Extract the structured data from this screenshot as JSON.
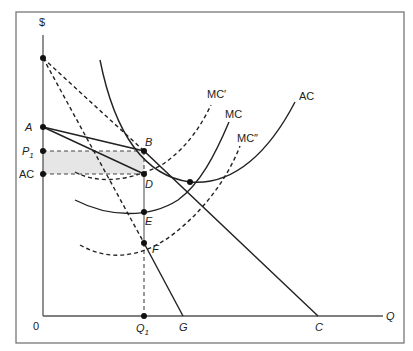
{
  "diagram": {
    "type": "economics-cost-revenue-diagram",
    "axes": {
      "y_label": "$",
      "x_label": "Q",
      "origin_label": "0"
    },
    "y_axis_labels": {
      "A": "A",
      "P1_main": "P",
      "P1_sub": "1",
      "AC": "AC"
    },
    "x_axis_labels": {
      "Q1_main": "Q",
      "Q1_sub": "1",
      "G": "G",
      "C": "C"
    },
    "points": {
      "B": "B",
      "D": "D",
      "E": "E",
      "F": "F"
    },
    "curves": {
      "mc_prime": "MC′",
      "mc": "MC",
      "mc_double_prime": "MC″",
      "ac": "AC"
    },
    "colors": {
      "line": "#222222",
      "shade": "#e6e6e6",
      "frame": "#777777"
    }
  }
}
